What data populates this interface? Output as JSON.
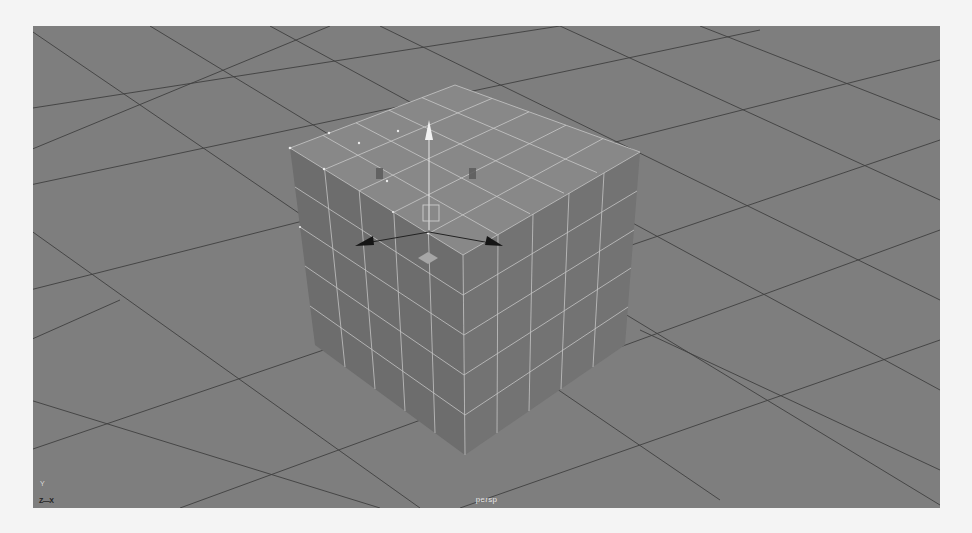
{
  "app": {
    "name": "3D modeling viewport",
    "view": "perspective"
  },
  "viewport": {
    "camera_label": "persp",
    "background_color": "#7e7e7e",
    "grid_line_color": "#3a3a3a",
    "axis_indicator": {
      "up_label": "Y",
      "horizontal_label": "Z—X"
    }
  },
  "scene": {
    "object": {
      "type": "polygon-cube",
      "subdivisions": [
        5,
        5,
        5
      ],
      "top_face_color": "#8a8a8a",
      "left_face_color": "#6e6e6e",
      "right_face_color": "#747474",
      "wireframe_color": "#d8d8d8"
    },
    "manipulator": {
      "type": "move-tool",
      "up_handle_color": "#f2f2f2",
      "side_handle_color": "#1a1a1a",
      "center_plane_color": "#a8a8a8"
    }
  }
}
